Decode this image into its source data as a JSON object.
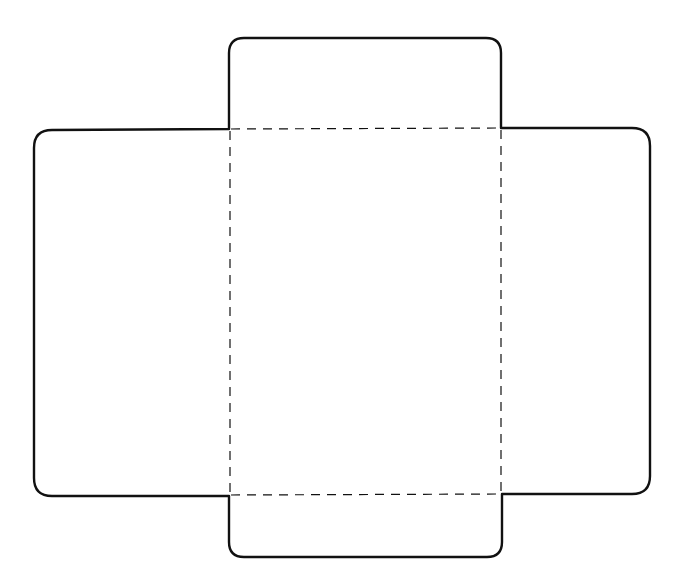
{
  "diagram": {
    "type": "box-net-template",
    "width": 679,
    "height": 584,
    "background": "#ffffff",
    "stroke_color": "#111111",
    "cut_line_width": 2.4,
    "fold_line_width": 1.2,
    "fold_dash": "9 7",
    "outline_path": "M 229 129 L 229 53 Q 229 38 244 38 L 486 38 Q 501 38 501 53 L 501 128 L 632 128 Q 650 128 650 146 L 650 476 Q 650 494 632 494 L 502 494 L 502 542 Q 502 557 487 557 L 244 557 Q 229 557 229 542 L 229 496 L 52 496 Q 34 496 34 478 L 34 148 Q 34 130 52 130 Z",
    "fold_lines": [
      {
        "name": "fold-top",
        "x1": 231,
        "y1": 129,
        "x2": 501,
        "y2": 128
      },
      {
        "name": "fold-bottom",
        "x1": 231,
        "y1": 495,
        "x2": 502,
        "y2": 494
      },
      {
        "name": "fold-left",
        "x1": 230,
        "y1": 131,
        "x2": 230,
        "y2": 495
      },
      {
        "name": "fold-right",
        "x1": 501,
        "y1": 130,
        "x2": 501,
        "y2": 494
      }
    ],
    "panels": [
      {
        "name": "top-flap"
      },
      {
        "name": "left-flap"
      },
      {
        "name": "center-panel"
      },
      {
        "name": "right-flap"
      },
      {
        "name": "bottom-flap"
      }
    ]
  }
}
